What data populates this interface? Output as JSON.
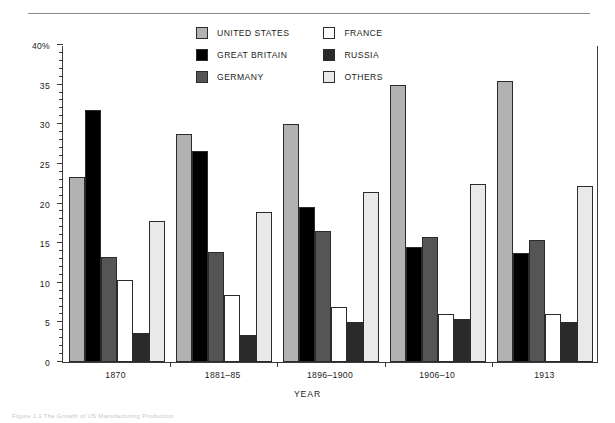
{
  "figure": {
    "caption": "Figure 1.1  The Growth of US Manufacturing Production",
    "rule_color": "#8a8a8a"
  },
  "legend": {
    "items": [
      {
        "label": "UNITED STATES",
        "color": "#b2b2b2",
        "key": "united_states"
      },
      {
        "label": "FRANCE",
        "color": "#ffffff",
        "key": "france"
      },
      {
        "label": "GREAT BRITAIN",
        "color": "#000000",
        "key": "great_britain"
      },
      {
        "label": "RUSSIA",
        "color": "#2a2a2a",
        "key": "russia"
      },
      {
        "label": "GERMANY",
        "color": "#555555",
        "key": "germany"
      },
      {
        "label": "OTHERS",
        "color": "#e9e9e9",
        "key": "others"
      }
    ]
  },
  "chart_data": {
    "type": "bar",
    "title": "",
    "xlabel": "YEAR",
    "ylabel": "PERCENTAGE (world)",
    "ylim": [
      0,
      40
    ],
    "ytick_values": [
      0,
      5,
      10,
      15,
      20,
      25,
      30,
      35,
      40
    ],
    "ytick_labels": [
      "0",
      "5",
      "10",
      "15",
      "20",
      "25",
      "30",
      "35",
      "40%"
    ],
    "ytick_minor_step": 1,
    "grid": false,
    "legend_position": "top-center",
    "categories": [
      "1870",
      "1881–85",
      "1896–1900",
      "1906–10",
      "1913"
    ],
    "series": [
      {
        "name": "UNITED STATES",
        "color": "#b2b2b2",
        "values": [
          23.3,
          28.8,
          30.0,
          35.0,
          35.5
        ]
      },
      {
        "name": "GREAT BRITAIN",
        "color": "#000000",
        "values": [
          31.8,
          26.6,
          19.5,
          14.5,
          13.7
        ]
      },
      {
        "name": "GERMANY",
        "color": "#555555",
        "values": [
          13.2,
          13.9,
          16.5,
          15.8,
          15.4
        ]
      },
      {
        "name": "FRANCE",
        "color": "#ffffff",
        "values": [
          10.3,
          8.4,
          7.0,
          6.1,
          6.0
        ]
      },
      {
        "name": "RUSSIA",
        "color": "#2a2a2a",
        "values": [
          3.7,
          3.4,
          5.0,
          5.4,
          5.0
        ]
      },
      {
        "name": "OTHERS",
        "color": "#e9e9e9",
        "values": [
          17.8,
          18.9,
          21.5,
          22.5,
          22.2
        ]
      }
    ]
  }
}
